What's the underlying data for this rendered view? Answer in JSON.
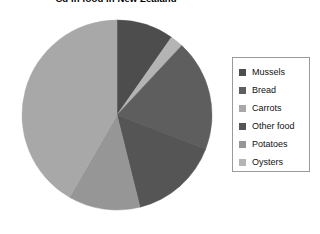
{
  "chart_data": {
    "type": "pie",
    "title": "Cd in food in New Zealand",
    "xlabel": "",
    "ylabel": "",
    "legend_position": "right",
    "grid": false,
    "start_angle_deg": 0,
    "direction": "clockwise",
    "categories": [
      "Mussels",
      "Bread",
      "Carrots",
      "Other food",
      "Potatoes",
      "Oysters"
    ],
    "values": [
      9.7,
      2.2,
      18.9,
      15.3,
      12.2,
      41.7
    ],
    "unit": "percent",
    "slices": [
      {
        "label": "Mussels",
        "value": 9.7,
        "angle_deg": 35,
        "color": "#4d4d4d"
      },
      {
        "label": "Bread",
        "value": 2.2,
        "angle_deg": 8,
        "color": "#b4b4b4"
      },
      {
        "label": "Carrots",
        "value": 18.9,
        "angle_deg": 68,
        "color": "#5e5e5e"
      },
      {
        "label": "Other food",
        "value": 15.3,
        "angle_deg": 55,
        "color": "#555555"
      },
      {
        "label": "Potatoes",
        "value": 12.2,
        "angle_deg": 44,
        "color": "#969696"
      },
      {
        "label": "Oysters",
        "value": 41.7,
        "angle_deg": 150,
        "color": "#a8a8a8"
      }
    ]
  },
  "legend": {
    "items": [
      {
        "label": "Mussels",
        "color": "#4d4d4d"
      },
      {
        "label": "Bread",
        "color": "#5e5e5e"
      },
      {
        "label": "Carrots",
        "color": "#a8a8a8"
      },
      {
        "label": "Other food",
        "color": "#555555"
      },
      {
        "label": "Potatoes",
        "color": "#969696"
      },
      {
        "label": "Oysters",
        "color": "#b4b4b4"
      }
    ]
  },
  "colors": {
    "background": "#ffffff",
    "legend_border": "#9a9a9a",
    "text": "#111111",
    "pie_edge": "#8c8c8c"
  }
}
